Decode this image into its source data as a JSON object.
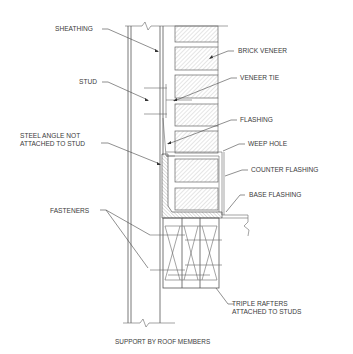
{
  "diagram": {
    "title": "SUPPORT BY ROOF MEMBERS",
    "labels": {
      "sheathing": "SHEATHING",
      "stud": "STUD",
      "steel_angle_line1": "STEEL ANGLE NOT",
      "steel_angle_line2": "ATTACHED TO STUD",
      "fasteners": "FASTENERS",
      "brick_veneer": "BRICK VENEER",
      "veneer_tie": "VENEER TIE",
      "flashing": "FLASHING",
      "weep_hole": "WEEP HOLE",
      "counter_flashing": "COUNTER FLASHING",
      "base_flashing": "BASE FLASHING",
      "triple_rafters_line1": "TRIPLE RAFTERS",
      "triple_rafters_line2": "ATTACHED TO STUDS"
    },
    "colors": {
      "line": "#555555",
      "text": "#3a3a3a",
      "background": "#ffffff"
    }
  }
}
